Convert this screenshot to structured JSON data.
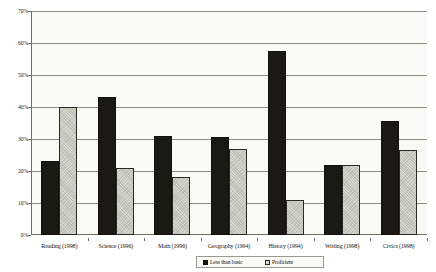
{
  "chart_data": {
    "type": "bar",
    "title": "",
    "subtitle": "",
    "xlabel": "",
    "ylabel": "",
    "ylim": [
      0,
      70
    ],
    "y_tick_step": 10,
    "y_tick_labels": [
      "0%",
      "10%",
      "20%",
      "30%",
      "40%",
      "50%",
      "60%",
      "70%"
    ],
    "y_tick_values": [
      0,
      10,
      20,
      30,
      40,
      50,
      60,
      70
    ],
    "grid": true,
    "legend_position": "bottom-center",
    "categories": [
      "Reading (1998)",
      "Science (1996)",
      "Math (1996)",
      "Geography (1994)",
      "History (1994)",
      "Writing (1998)",
      "Civics (1998)"
    ],
    "series": [
      {
        "name": "Less than basic",
        "color": "#1c1813",
        "values": [
          23,
          43,
          31,
          30.5,
          57.5,
          22,
          35.5
        ]
      },
      {
        "name": "Proficient",
        "color": "#d8d7cf",
        "values": [
          40,
          21,
          18,
          27,
          11,
          22,
          26.5
        ]
      }
    ]
  },
  "legend": {
    "entries": [
      {
        "label": "Less than basic"
      },
      {
        "label": "Proficient"
      }
    ]
  },
  "colors": {
    "less_than_basic": "#1c1813",
    "proficient": "#d8d7cf",
    "gridline": "#8d8d82",
    "axis": "#6f6f66",
    "plot_background": "#faf9f5",
    "page_background": "#ffffff"
  }
}
